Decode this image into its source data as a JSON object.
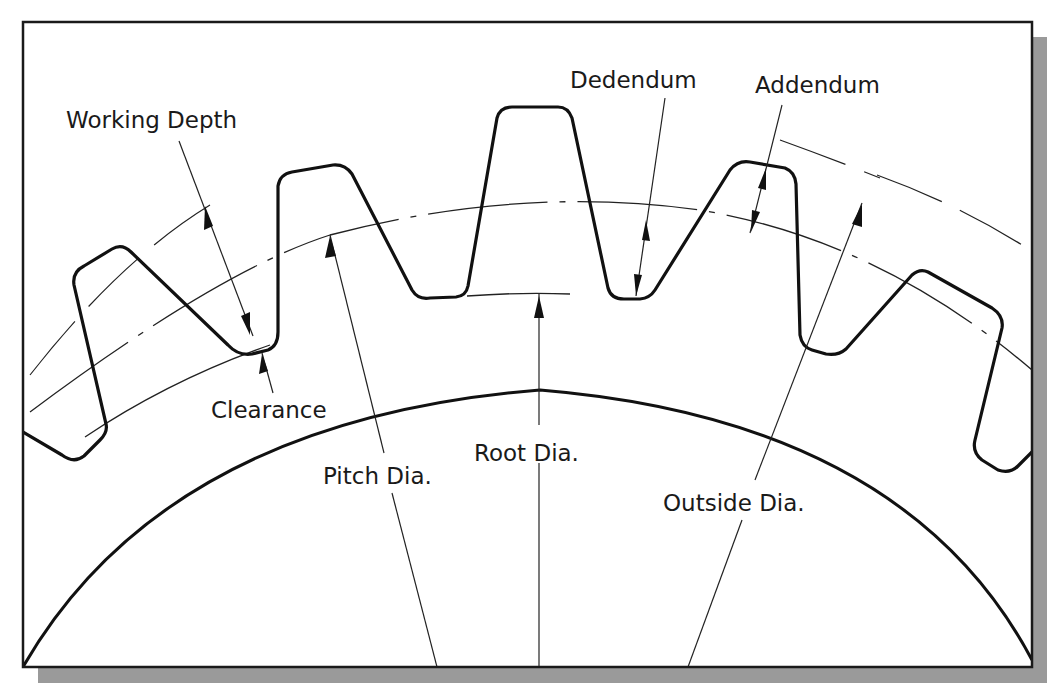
{
  "figure": {
    "labels": {
      "working_depth": "Working Depth",
      "dedendum": "Dedendum",
      "addendum": "Addendum",
      "clearance": "Clearance",
      "pitch_dia": "Pitch Dia.",
      "root_dia": "Root Dia.",
      "outside_dia": "Outside Dia."
    },
    "colors": {
      "line": "#111111",
      "background": "#ffffff",
      "shadow": "#9a9a9a"
    }
  }
}
